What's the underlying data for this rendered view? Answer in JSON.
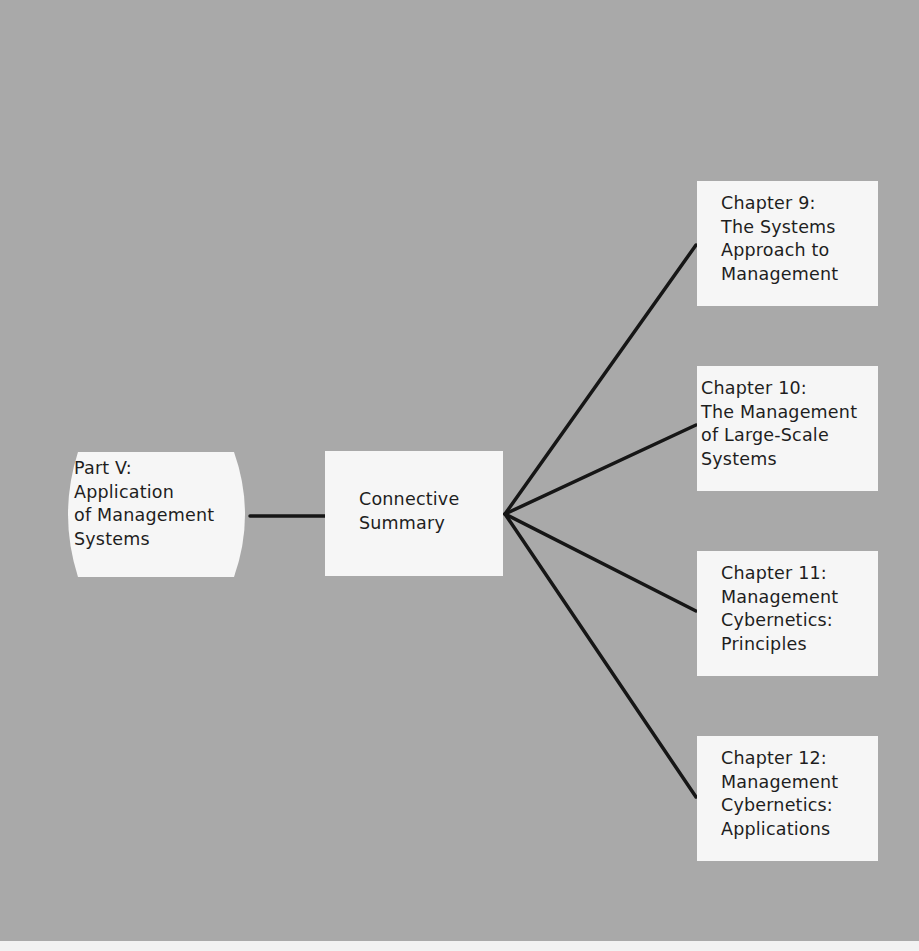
{
  "diagram": {
    "type": "tree-flow",
    "colors": {
      "background": "#a9a9a9",
      "box_fill": "#f6f6f6",
      "text": "#1e1e1e",
      "connector": "#161616"
    },
    "root": {
      "id": "part-v",
      "shape": "barrel",
      "lines": [
        "Part V:",
        "Application",
        "of Management",
        "Systems"
      ]
    },
    "hub": {
      "id": "connective-summary",
      "shape": "rectangle",
      "lines": [
        "Connective",
        "Summary"
      ]
    },
    "chapters": [
      {
        "id": "chapter-9",
        "lines": [
          "Chapter 9:",
          "The Systems",
          "Approach to",
          "Management"
        ]
      },
      {
        "id": "chapter-10",
        "lines": [
          "Chapter 10:",
          "The Management",
          "of Large-Scale",
          "Systems"
        ]
      },
      {
        "id": "chapter-11",
        "lines": [
          "Chapter 11:",
          "Management",
          "Cybernetics:",
          "Principles"
        ]
      },
      {
        "id": "chapter-12",
        "lines": [
          "Chapter 12:",
          "Management",
          "Cybernetics:",
          "Applications"
        ]
      }
    ],
    "edges": [
      {
        "from": "part-v",
        "to": "connective-summary"
      },
      {
        "from": "connective-summary",
        "to": "chapter-9"
      },
      {
        "from": "connective-summary",
        "to": "chapter-10"
      },
      {
        "from": "connective-summary",
        "to": "chapter-11"
      },
      {
        "from": "connective-summary",
        "to": "chapter-12"
      }
    ]
  }
}
